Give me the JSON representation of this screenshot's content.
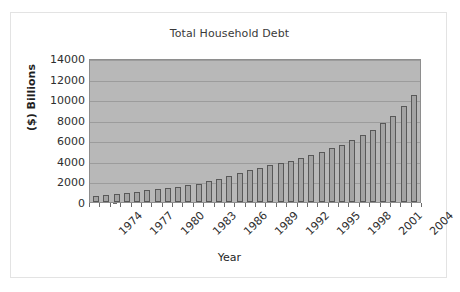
{
  "chart_data": {
    "type": "bar",
    "title": "Total Household Debt",
    "xlabel": "Year",
    "ylabel": "($) Billions",
    "ylim": [
      0,
      14000
    ],
    "ytick_step": 2000,
    "yticks": [
      "0",
      "2000",
      "4000",
      "6000",
      "8000",
      "10000",
      "12000",
      "14000"
    ],
    "grid": true,
    "legend": "none",
    "categories": [
      "1974",
      "1975",
      "1976",
      "1977",
      "1978",
      "1979",
      "1980",
      "1981",
      "1982",
      "1983",
      "1984",
      "1985",
      "1986",
      "1987",
      "1988",
      "1989",
      "1990",
      "1991",
      "1992",
      "1993",
      "1994",
      "1995",
      "1996",
      "1997",
      "1998",
      "1999",
      "2000",
      "2001",
      "2002",
      "2003",
      "2004",
      "2005"
    ],
    "xtick_labels": [
      "1974",
      "1977",
      "1980",
      "1983",
      "1986",
      "1989",
      "1992",
      "1995",
      "1998",
      "2001",
      "2004"
    ],
    "values": [
      620,
      680,
      760,
      880,
      1020,
      1180,
      1290,
      1400,
      1470,
      1620,
      1800,
      2030,
      2280,
      2560,
      2820,
      3110,
      3350,
      3620,
      3810,
      4020,
      4280,
      4580,
      4890,
      5240,
      5580,
      6020,
      6480,
      7000,
      7640,
      8400,
      9330,
      10380
    ],
    "colors": {
      "bar_fill": "#a3a3a3",
      "bar_border": "#585858",
      "plot_background": "#b8b8b8",
      "gridline": "#9c9c9c",
      "text": "#2e2e2e"
    }
  }
}
